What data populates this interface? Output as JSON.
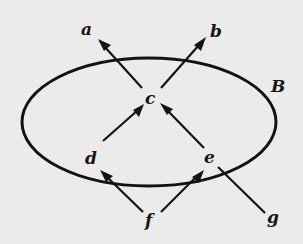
{
  "diagram": {
    "type": "directed-graph-with-set-boundary",
    "set": {
      "label": "B",
      "shape": "ellipse",
      "contains": [
        "c",
        "d",
        "e"
      ]
    },
    "nodes": [
      {
        "id": "a",
        "label": "a",
        "x": 88,
        "y": 31
      },
      {
        "id": "b",
        "label": "b",
        "x": 216,
        "y": 34
      },
      {
        "id": "c",
        "label": "c",
        "x": 152,
        "y": 101
      },
      {
        "id": "d",
        "label": "d",
        "x": 92,
        "y": 160
      },
      {
        "id": "e",
        "label": "e",
        "x": 210,
        "y": 160
      },
      {
        "id": "f",
        "label": "f",
        "x": 150,
        "y": 222
      },
      {
        "id": "g",
        "label": "g",
        "x": 272,
        "y": 222
      }
    ],
    "edges": [
      {
        "from": "c",
        "to": "a"
      },
      {
        "from": "c",
        "to": "b"
      },
      {
        "from": "d",
        "to": "c"
      },
      {
        "from": "e",
        "to": "c"
      },
      {
        "from": "f",
        "to": "d"
      },
      {
        "from": "f",
        "to": "e"
      },
      {
        "from": "g",
        "to": "e"
      }
    ]
  },
  "labels": {
    "a": "a",
    "b": "b",
    "c": "c",
    "d": "d",
    "e": "e",
    "f": "f",
    "g": "g",
    "B": "B"
  }
}
